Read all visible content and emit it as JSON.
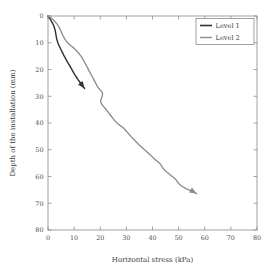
{
  "chart_data": {
    "type": "line",
    "title": "",
    "xlabel": "Horizontal stress (kPa)",
    "ylabel": "Depth of the installation (mm)",
    "xlim": [
      0,
      80
    ],
    "ylim": [
      80,
      0
    ],
    "y_inverted": true,
    "grid": false,
    "legend_position": "top-right",
    "xticks": [
      0,
      10,
      20,
      30,
      40,
      50,
      60,
      70,
      80
    ],
    "yticks": [
      0,
      10,
      20,
      30,
      40,
      50,
      60,
      70,
      80
    ],
    "xtick_labels": [
      "0",
      "10",
      "20",
      "30",
      "40",
      "50",
      "60",
      "70",
      "80"
    ],
    "ytick_labels": [
      "0",
      "10",
      "20",
      "30",
      "40",
      "50",
      "60",
      "70",
      "80"
    ],
    "series": [
      {
        "name": "Level 1",
        "color": "#333333",
        "end_marker": "arrow",
        "points": [
          [
            0.0,
            0.0
          ],
          [
            0.5,
            0.6
          ],
          [
            1.0,
            1.4
          ],
          [
            1.5,
            2.3
          ],
          [
            2.0,
            3.2
          ],
          [
            2.4,
            4.2
          ],
          [
            2.7,
            5.2
          ],
          [
            2.9,
            6.2
          ],
          [
            3.1,
            7.3
          ],
          [
            3.3,
            8.4
          ],
          [
            3.6,
            9.5
          ],
          [
            4.0,
            10.6
          ],
          [
            4.5,
            11.6
          ],
          [
            5.0,
            12.6
          ],
          [
            5.5,
            13.6
          ],
          [
            6.0,
            14.6
          ],
          [
            6.5,
            15.5
          ],
          [
            7.0,
            16.4
          ],
          [
            7.6,
            17.4
          ],
          [
            8.2,
            18.4
          ],
          [
            8.8,
            19.4
          ],
          [
            9.3,
            20.3
          ],
          [
            9.8,
            21.2
          ],
          [
            10.3,
            22.0
          ],
          [
            10.9,
            22.9
          ],
          [
            11.5,
            23.8
          ],
          [
            12.1,
            24.6
          ],
          [
            12.7,
            25.4
          ],
          [
            13.2,
            26.1
          ],
          [
            13.7,
            26.7
          ],
          [
            14.0,
            27.1
          ]
        ]
      },
      {
        "name": "Level 2",
        "color": "#8d8d8d",
        "end_marker": "arrow",
        "points": [
          [
            0.0,
            0.0
          ],
          [
            1.2,
            0.8
          ],
          [
            2.3,
            1.7
          ],
          [
            3.2,
            2.7
          ],
          [
            4.0,
            3.8
          ],
          [
            4.6,
            4.9
          ],
          [
            5.1,
            6.0
          ],
          [
            5.6,
            7.1
          ],
          [
            6.2,
            8.2
          ],
          [
            6.9,
            9.3
          ],
          [
            7.8,
            10.3
          ],
          [
            8.9,
            11.2
          ],
          [
            10.0,
            12.1
          ],
          [
            11.0,
            13.1
          ],
          [
            11.9,
            14.1
          ],
          [
            12.7,
            15.1
          ],
          [
            13.4,
            16.2
          ],
          [
            14.0,
            17.3
          ],
          [
            14.6,
            18.4
          ],
          [
            15.2,
            19.5
          ],
          [
            15.8,
            20.6
          ],
          [
            16.4,
            21.7
          ],
          [
            17.0,
            22.8
          ],
          [
            17.6,
            23.9
          ],
          [
            18.2,
            25.0
          ],
          [
            18.8,
            26.1
          ],
          [
            19.4,
            27.0
          ],
          [
            20.0,
            27.7
          ],
          [
            20.6,
            28.3
          ],
          [
            20.9,
            29.0
          ],
          [
            20.8,
            29.8
          ],
          [
            20.5,
            30.6
          ],
          [
            20.2,
            31.4
          ],
          [
            20.2,
            32.2
          ],
          [
            20.6,
            33.0
          ],
          [
            21.2,
            33.8
          ],
          [
            21.9,
            34.6
          ],
          [
            22.6,
            35.4
          ],
          [
            23.3,
            36.3
          ],
          [
            24.0,
            37.2
          ],
          [
            24.7,
            38.1
          ],
          [
            25.4,
            39.0
          ],
          [
            26.2,
            39.8
          ],
          [
            27.0,
            40.5
          ],
          [
            27.9,
            41.1
          ],
          [
            28.8,
            41.8
          ],
          [
            29.6,
            42.6
          ],
          [
            30.4,
            43.5
          ],
          [
            31.2,
            44.4
          ],
          [
            32.0,
            45.3
          ],
          [
            32.9,
            46.2
          ],
          [
            33.8,
            47.1
          ],
          [
            34.7,
            48.0
          ],
          [
            35.6,
            48.8
          ],
          [
            36.5,
            49.6
          ],
          [
            37.4,
            50.4
          ],
          [
            38.3,
            51.2
          ],
          [
            39.2,
            52.0
          ],
          [
            40.1,
            52.8
          ],
          [
            41.0,
            53.6
          ],
          [
            41.9,
            54.4
          ],
          [
            42.8,
            55.1
          ],
          [
            43.4,
            55.9
          ],
          [
            43.9,
            56.8
          ],
          [
            44.6,
            57.6
          ],
          [
            45.4,
            58.3
          ],
          [
            46.3,
            59.0
          ],
          [
            47.2,
            59.7
          ],
          [
            48.1,
            60.4
          ],
          [
            48.9,
            61.1
          ],
          [
            49.5,
            61.9
          ],
          [
            50.1,
            62.7
          ],
          [
            50.9,
            63.4
          ],
          [
            51.9,
            64.0
          ],
          [
            53.0,
            64.6
          ],
          [
            54.2,
            65.1
          ],
          [
            55.3,
            65.6
          ],
          [
            56.2,
            66.0
          ],
          [
            56.9,
            66.4
          ]
        ]
      }
    ]
  },
  "legend": {
    "entries": [
      {
        "label": "Level 1"
      },
      {
        "label": "Level 2"
      }
    ]
  },
  "axes": {
    "x_title": "Horizontal stress (kPa)",
    "y_title": "Depth of the installation (mm)"
  }
}
